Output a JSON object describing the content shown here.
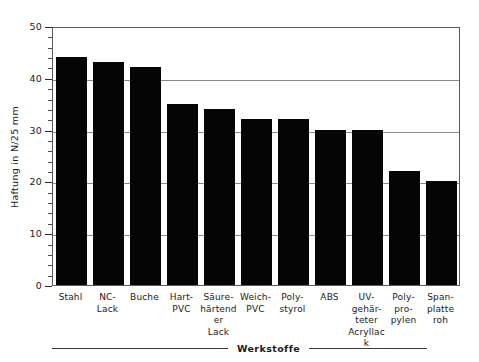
{
  "chart_data": {
    "type": "bar",
    "title": "",
    "xlabel": "Werkstoffe",
    "ylabel": "Haftung in N/25 mm",
    "ylim": [
      0,
      50
    ],
    "ytick_major": [
      0,
      10,
      20,
      30,
      40,
      50
    ],
    "ytick_minor_step": 2,
    "gridlines": [
      10,
      20,
      30,
      40
    ],
    "grid": true,
    "legend": null,
    "bar_color": "#050505",
    "categories": [
      "Stahl",
      "NC-\nLack",
      "Buche",
      "Hart-\nPVC",
      "Säure-\nhärtender\nLack",
      "Weich-\nPVC",
      "Poly-\nstyrol",
      "ABS",
      "UV-\ngehär-\nteter\nAcryllack",
      "Poly-\npro-\npylen",
      "Span-\nplatte\nroh"
    ],
    "values": [
      44,
      43,
      42,
      35,
      34,
      32,
      32,
      30,
      30,
      22,
      20
    ]
  },
  "axis": {
    "y_title": "Haftung in N/25 mm",
    "x_caption": "Werkstoffe",
    "y_labels": [
      "50",
      "40",
      "30",
      "20",
      "10",
      "0"
    ]
  }
}
